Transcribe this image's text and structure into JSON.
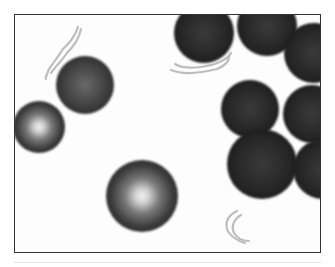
{
  "image": {
    "subject": "microscopy image of red blood cells with filamentous debris",
    "frame_color": "#333333",
    "background_color": "#fdfdfd",
    "cells": [
      {
        "name": "cell-left-lit",
        "cx": 38,
        "cy": 126,
        "r": 26,
        "style": "lit"
      },
      {
        "name": "cell-upper-left",
        "cx": 84,
        "cy": 84,
        "r": 29,
        "style": "mid"
      },
      {
        "name": "cell-center-lit",
        "cx": 141,
        "cy": 195,
        "r": 36,
        "style": "lit"
      },
      {
        "name": "cell-top-center",
        "cx": 203,
        "cy": 32,
        "r": 30,
        "style": "dark"
      },
      {
        "name": "cell-top-right",
        "cx": 266,
        "cy": 25,
        "r": 30,
        "style": "dark"
      },
      {
        "name": "cell-right-upper",
        "cx": 313,
        "cy": 52,
        "r": 30,
        "style": "dark"
      },
      {
        "name": "cell-right-mid",
        "cx": 249,
        "cy": 108,
        "r": 29,
        "style": "dark"
      },
      {
        "name": "cell-right-mid2",
        "cx": 311,
        "cy": 113,
        "r": 29,
        "style": "dark"
      },
      {
        "name": "cell-right-lower",
        "cx": 261,
        "cy": 163,
        "r": 35,
        "style": "dark"
      },
      {
        "name": "cell-right-bottom",
        "cx": 322,
        "cy": 168,
        "r": 30,
        "style": "dark"
      }
    ]
  }
}
